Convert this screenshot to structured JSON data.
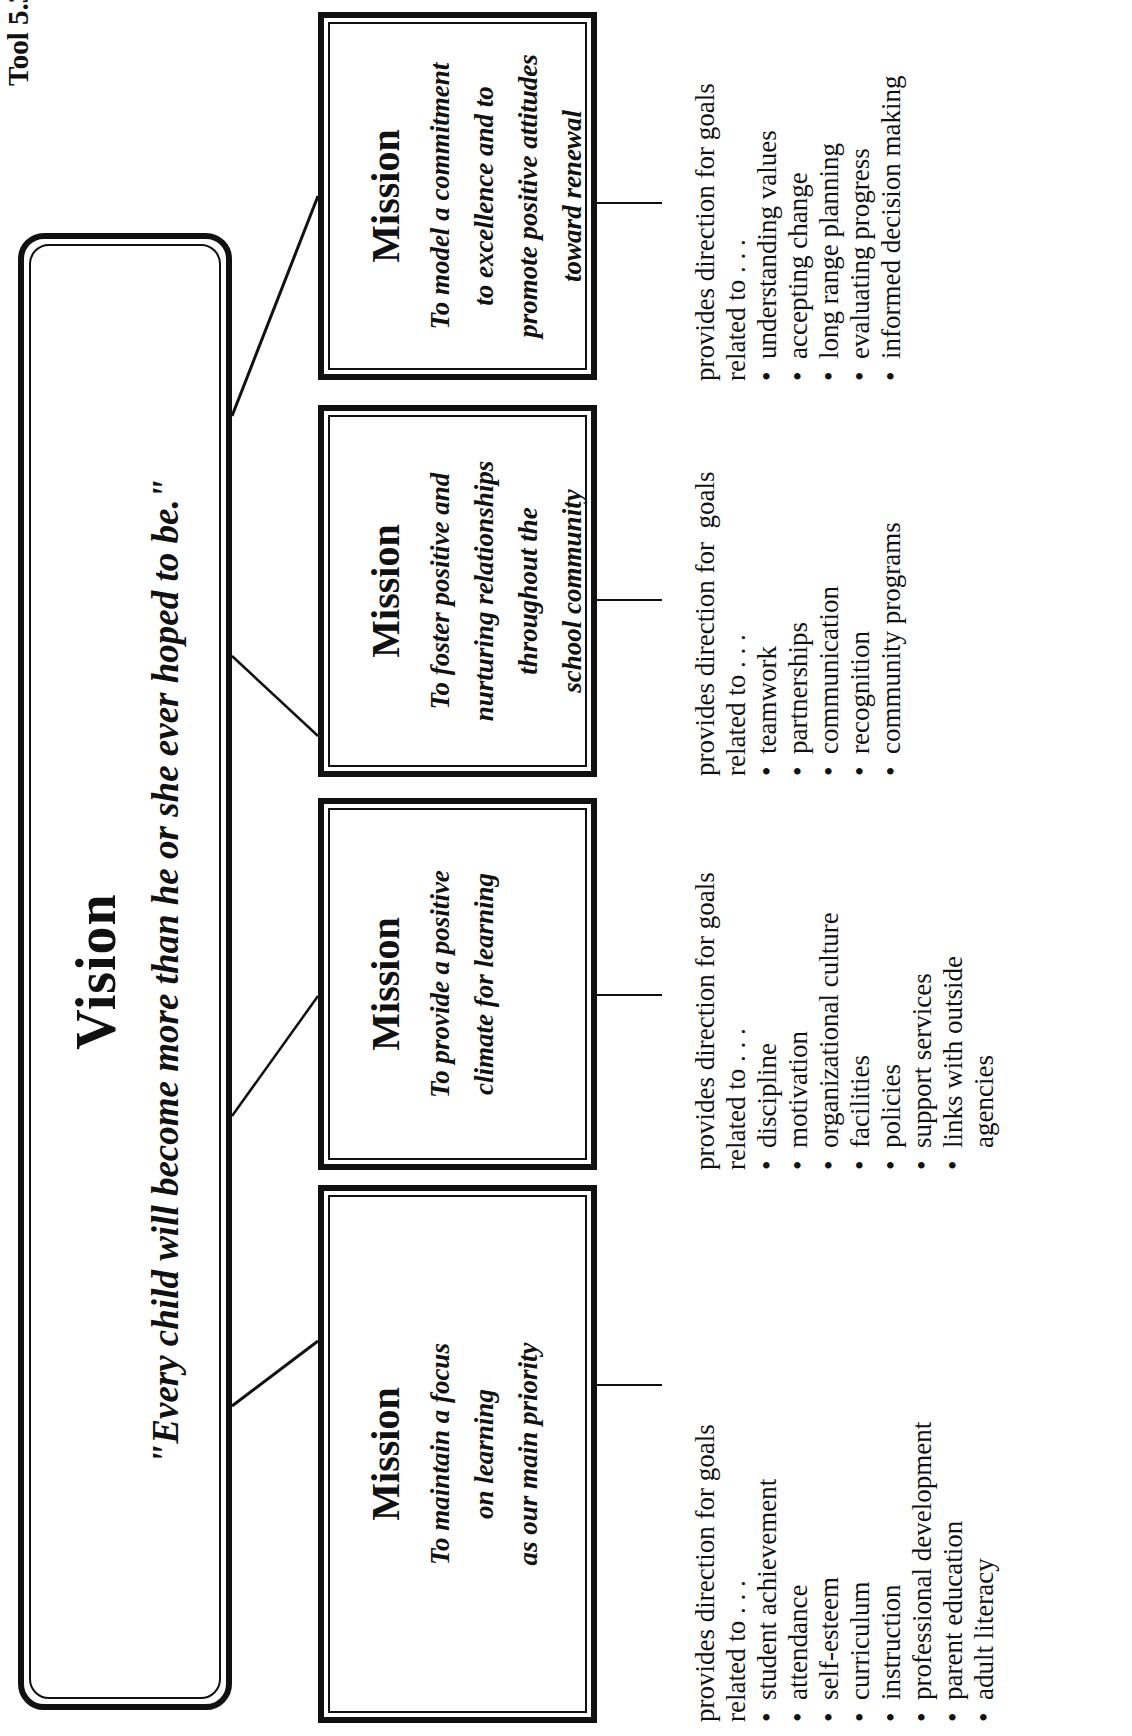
{
  "tool_label": "Tool 5.3",
  "vision": {
    "title": "Vision",
    "quote": "\"Every child will become more than he or she ever hoped to be.\""
  },
  "missions": [
    {
      "title": "Mission",
      "lines": [
        "To maintain a focus",
        "on learning",
        "as our main priority"
      ],
      "goals_intro": [
        "provides direction for goals",
        "related to . . ."
      ],
      "goals": [
        "student achievement",
        "attendance",
        "self-esteem",
        "curriculum",
        "instruction",
        "professional development",
        "parent education",
        "adult literacy"
      ]
    },
    {
      "title": "Mission",
      "lines": [
        "To provide a positive",
        "climate for learning"
      ],
      "goals_intro": [
        "provides direction for goals",
        "related to . . ."
      ],
      "goals": [
        "discipline",
        "motivation",
        "organizational culture",
        "facilities",
        "policies",
        "support services",
        "links with outside"
      ],
      "goals_continuation": "agencies"
    },
    {
      "title": "Mission",
      "lines": [
        "To foster positive and",
        "nurturing relationships",
        "throughout the",
        "school community"
      ],
      "goals_intro": [
        "provides direction for  goals",
        "related to . . ."
      ],
      "goals": [
        "teamwork",
        "partnerships",
        "communication",
        "recognition",
        "community programs"
      ]
    },
    {
      "title": "Mission",
      "lines": [
        "To model a commitment",
        "to excellence and to",
        "promote positive attitudes",
        "toward renewal"
      ],
      "goals_intro": [
        "provides direction for goals",
        "related to . . ."
      ],
      "goals": [
        "understanding values",
        "accepting change",
        "long range planning",
        "evaluating progress",
        "informed decision making"
      ]
    }
  ],
  "bullet_glyph": "•",
  "colors": {
    "ink": "#111111",
    "paper": "#ffffff"
  }
}
